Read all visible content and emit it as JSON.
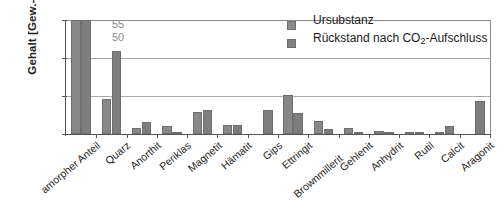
{
  "chart_data": {
    "type": "bar",
    "title": "",
    "subtitle": "",
    "xlabel": "",
    "ylabel": "Gehalt [Gew.-%]",
    "ylim": [
      0,
      30
    ],
    "yticks": [
      0,
      10,
      20,
      30
    ],
    "grid": true,
    "legend_position": "top-right",
    "categories": [
      "amorpher Anteil",
      "Quarz",
      "Anorthit",
      "Periklas",
      "Magnetit",
      "Hämatit",
      "Gips",
      "Ettringit",
      "Brownmillerit",
      "Gehlenit",
      "Anhydrit",
      "Rutil",
      "Calcit",
      "Aragonit"
    ],
    "series": [
      {
        "name": "Ursubstanz",
        "values": [
          50,
          9.3,
          1.7,
          2.2,
          5.9,
          2.5,
          0.0,
          10.2,
          3.4,
          1.7,
          0.9,
          0.3,
          0.2,
          0.0
        ]
      },
      {
        "name": "Rückstand nach CO2-Aufschluss",
        "values": [
          55,
          21.8,
          3.2,
          0.2,
          6.3,
          2.5,
          6.2,
          5.5,
          1.4,
          0.1,
          0.5,
          0.4,
          2.1,
          8.6
        ]
      }
    ],
    "clipped_bars": [
      {
        "category": "amorpher Anteil",
        "axis_max": 30,
        "labels": [
          "55",
          "50"
        ]
      }
    ],
    "colors": {
      "series_1": "#888888",
      "series_2": "#7e7e7e",
      "grid": "#a9a9a9",
      "axis": "#555555",
      "clip_label": "#8a8a8a"
    }
  },
  "legend": {
    "items": [
      {
        "label": "Ursubstanz",
        "label_main": "Ursubstanz",
        "label_sub": "",
        "label_tail": ""
      },
      {
        "label": "Rückstand nach CO2-Aufschluss",
        "label_main": "Rückstand nach CO",
        "label_sub": "2",
        "label_tail": "-Aufschluss"
      }
    ]
  },
  "axis": {
    "y_title_main": "Gehalt [Gew.-%]",
    "y_tick_labels": [
      "30",
      "20",
      "10",
      "0"
    ]
  }
}
